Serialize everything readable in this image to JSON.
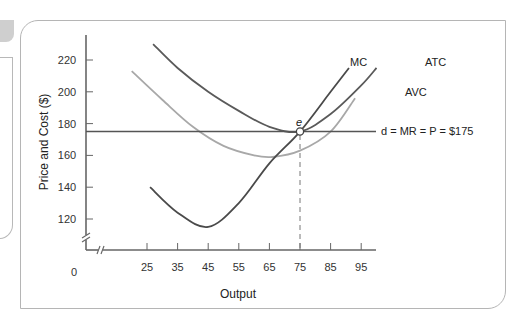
{
  "chart_data": {
    "type": "line",
    "title": "",
    "xlabel": "Output",
    "ylabel": "Price and Cost ($)",
    "x_ticks": [
      25,
      35,
      45,
      55,
      65,
      75,
      85,
      95
    ],
    "y_ticks": [
      120,
      140,
      160,
      180,
      200,
      220
    ],
    "origin_label": "0",
    "xlim": [
      0,
      100
    ],
    "ylim": [
      0,
      230
    ],
    "axis_breaks": true,
    "grid": false,
    "series": [
      {
        "name": "MC",
        "color": "#4a4a4a",
        "points": [
          [
            26,
            140
          ],
          [
            35,
            124
          ],
          [
            45,
            115
          ],
          [
            55,
            130
          ],
          [
            65,
            155
          ],
          [
            75,
            175
          ],
          [
            85,
            200
          ],
          [
            91,
            215
          ]
        ]
      },
      {
        "name": "ATC",
        "color": "#5a5a5a",
        "points": [
          [
            27,
            230
          ],
          [
            35,
            215
          ],
          [
            45,
            200
          ],
          [
            55,
            188
          ],
          [
            65,
            178
          ],
          [
            75,
            175
          ],
          [
            85,
            186
          ],
          [
            95,
            204
          ],
          [
            100,
            215
          ]
        ]
      },
      {
        "name": "AVC",
        "color": "#a8a8a8",
        "points": [
          [
            20,
            213
          ],
          [
            30,
            195
          ],
          [
            40,
            178
          ],
          [
            50,
            166
          ],
          [
            60,
            160
          ],
          [
            66,
            159
          ],
          [
            75,
            163
          ],
          [
            85,
            175
          ],
          [
            93,
            196
          ]
        ]
      },
      {
        "name": "d = MR = P = $175",
        "color": "#555555",
        "points": [
          [
            0,
            175
          ],
          [
            105,
            175
          ]
        ]
      }
    ],
    "annotations": [
      {
        "label": "e",
        "x": 75,
        "y": 175,
        "type": "equilibrium-point"
      },
      {
        "type": "dashed-drop-line",
        "x": 75,
        "from_y": 175,
        "to_y": 0
      }
    ],
    "labels": {
      "mc": "MC",
      "atc": "ATC",
      "avc": "AVC",
      "demand": "d = MR = P = $175",
      "equilibrium": "e"
    }
  }
}
